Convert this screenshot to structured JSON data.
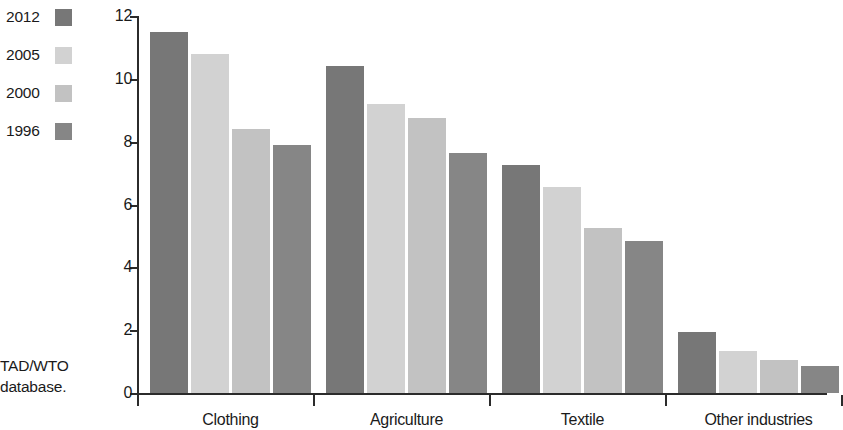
{
  "legend": {
    "items": [
      {
        "label": "2012",
        "color": "#777777"
      },
      {
        "label": "2005",
        "color": "#d2d2d2"
      },
      {
        "label": "2000",
        "color": "#c2c2c2"
      },
      {
        "label": "1996",
        "color": "#868686"
      }
    ]
  },
  "source_note": "TAD/WTO\ndatabase.",
  "chart_data": {
    "type": "bar",
    "title": "",
    "subtitle": "",
    "xlabel": "",
    "ylabel": "",
    "ylim": [
      0,
      12
    ],
    "yticks": [
      0,
      2,
      4,
      6,
      8,
      10,
      12
    ],
    "ytick_labels": [
      "0",
      "2",
      "4",
      "6",
      "8",
      "10",
      "12"
    ],
    "grid": false,
    "legend_position": "top-left",
    "categories": [
      "Clothing",
      "Agriculture",
      "Textile",
      "Other industries"
    ],
    "series": [
      {
        "name": "2012",
        "color": "#777777",
        "values": [
          11.5,
          10.4,
          7.25,
          1.95
        ]
      },
      {
        "name": "2005",
        "color": "#d2d2d2",
        "values": [
          10.8,
          9.2,
          6.55,
          1.35
        ]
      },
      {
        "name": "2000",
        "color": "#c2c2c2",
        "values": [
          8.4,
          8.75,
          5.25,
          1.05
        ]
      },
      {
        "name": "1996",
        "color": "#868686",
        "values": [
          7.9,
          7.65,
          4.85,
          0.85
        ]
      }
    ]
  }
}
